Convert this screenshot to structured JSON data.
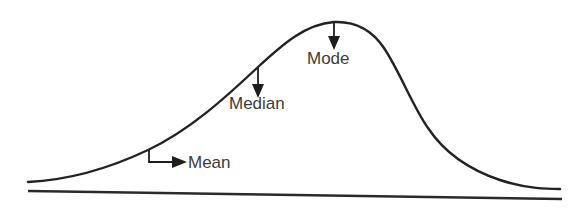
{
  "diagram": {
    "title": "",
    "type": "skewed-distribution-curve",
    "skew": "negative (left-skewed)",
    "colors": {
      "line": "#222222",
      "text": "#3c3c3c",
      "background": "#ffffff"
    },
    "labels": {
      "mode": "Mode",
      "median": "Median",
      "mean": "Mean"
    },
    "markers": [
      {
        "name": "mode",
        "label": "Mode",
        "pointer": "down-arrow",
        "order_on_x_axis": 3
      },
      {
        "name": "median",
        "label": "Median",
        "pointer": "down-arrow",
        "order_on_x_axis": 2
      },
      {
        "name": "mean",
        "label": "Mean",
        "pointer": "bent-right-arrow",
        "order_on_x_axis": 1
      }
    ]
  }
}
